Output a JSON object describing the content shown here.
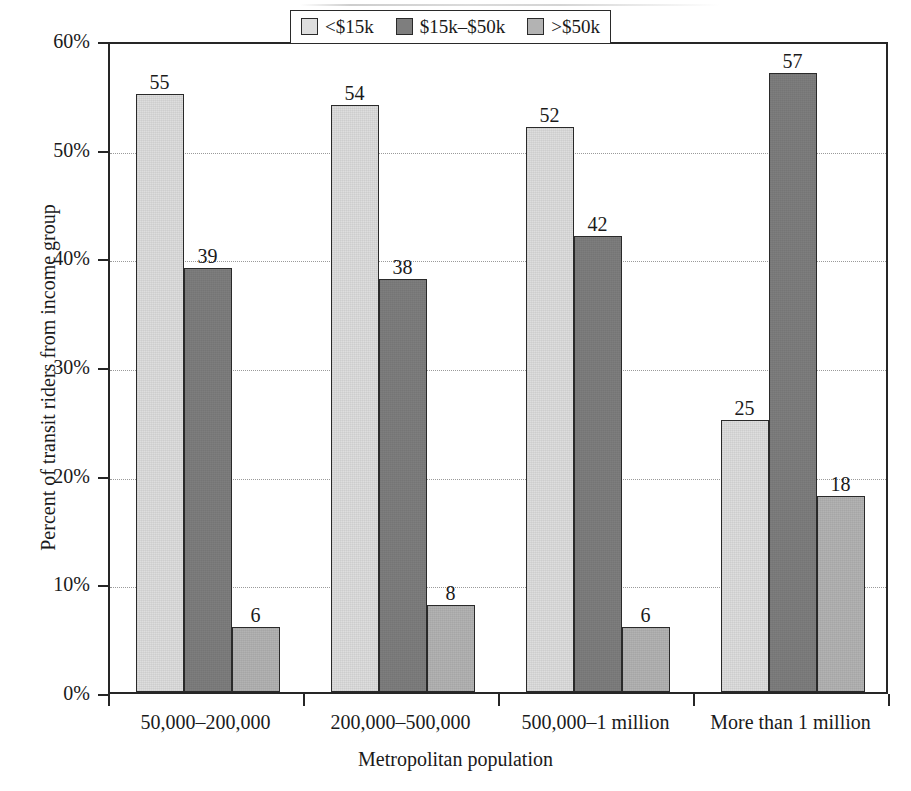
{
  "chart_data": {
    "type": "bar",
    "title": "",
    "xlabel": "Metropolitan population",
    "ylabel": "Percent of transit riders from income group",
    "categories": [
      "50,000–200,000",
      "200,000–500,000",
      "500,000–1 million",
      "More than 1 million"
    ],
    "series": [
      {
        "name": "<$15k",
        "color": "#dedede",
        "values": [
          55,
          54,
          52,
          25
        ]
      },
      {
        "name": "$15k–$50k",
        "color": "#7e7e7e",
        "values": [
          39,
          38,
          42,
          57
        ]
      },
      {
        "name": ">$50k",
        "color": "#b3b3b3",
        "values": [
          6,
          8,
          6,
          18
        ]
      }
    ],
    "ylim": [
      0,
      60
    ],
    "ytick_values": [
      0,
      10,
      20,
      30,
      40,
      50,
      60
    ],
    "ytick_labels": [
      "0%",
      "10%",
      "20%",
      "30%",
      "40%",
      "50%",
      "60%"
    ],
    "grid": "horizontal-dotted",
    "legend_position": "top-center-inside",
    "value_labels": true
  },
  "axes": {
    "y_title": "Percent of transit riders from income group",
    "x_title": "Metropolitan population"
  },
  "legend": {
    "items": [
      {
        "label": "<$15k"
      },
      {
        "label": "$15k–$50k"
      },
      {
        "label": ">$50k"
      }
    ]
  }
}
